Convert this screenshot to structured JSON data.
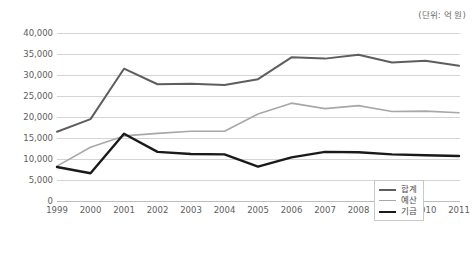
{
  "unit_note": "(단위: 억 원)",
  "legend": {
    "position": "bottom-right",
    "items": [
      {
        "label": "합계",
        "color": "#5e5e5e",
        "width": 2.0
      },
      {
        "label": "예산",
        "color": "#a8a8a8",
        "width": 1.6
      },
      {
        "label": "기금",
        "color": "#1a1a1a",
        "width": 2.4
      }
    ]
  },
  "axis": {
    "y_ticks": [
      "0",
      "5,000",
      "10,000",
      "15,000",
      "20,000",
      "25,000",
      "30,000",
      "35,000",
      "40,000"
    ],
    "x_ticks": [
      "1999",
      "2000",
      "2001",
      "2002",
      "2003",
      "2004",
      "2005",
      "2006",
      "2007",
      "2008",
      "2009",
      "2010",
      "2011"
    ]
  },
  "chart_data": {
    "type": "line",
    "title": "",
    "subtitle": "",
    "xlabel": "",
    "ylabel": "",
    "unit": "(단위: 억 원)",
    "grid": true,
    "legend_position": "bottom-right",
    "ylim": [
      0,
      40000
    ],
    "ytick_step": 5000,
    "categories": [
      "1999",
      "2000",
      "2001",
      "2002",
      "2003",
      "2004",
      "2005",
      "2006",
      "2007",
      "2008",
      "2009",
      "2010",
      "2011"
    ],
    "series": [
      {
        "name": "합계",
        "color": "#5e5e5e",
        "values": [
          16500,
          19500,
          31500,
          27800,
          27900,
          27600,
          29000,
          34200,
          33900,
          34800,
          33000,
          33400,
          32200
        ]
      },
      {
        "name": "예산",
        "color": "#a8a8a8",
        "values": [
          8300,
          12800,
          15500,
          16100,
          16600,
          16600,
          20700,
          23300,
          22000,
          22700,
          21300,
          21400,
          21000
        ]
      },
      {
        "name": "기금",
        "color": "#1a1a1a",
        "values": [
          8100,
          6600,
          16000,
          11700,
          11200,
          11100,
          8200,
          10400,
          11700,
          11600,
          11100,
          10900,
          10700
        ]
      }
    ]
  }
}
